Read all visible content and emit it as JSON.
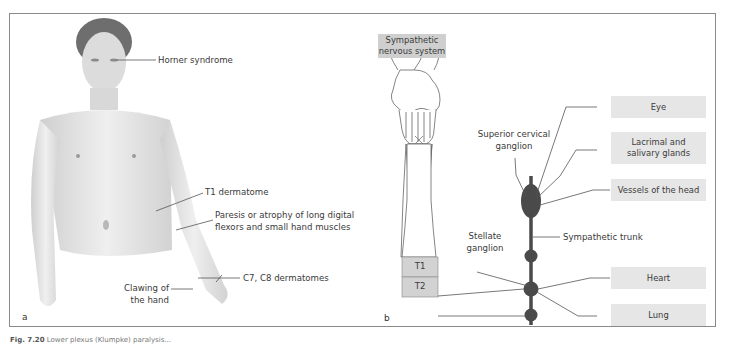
{
  "figure": {
    "panel_a": {
      "letter": "a",
      "labels": {
        "horner": "Horner syndrome",
        "t1_dermatome": "T1 dermatome",
        "paresis_line1": "Paresis or atrophy of long digital",
        "paresis_line2": "flexors and small hand muscles",
        "c7c8": "C7, C8 dermatomes",
        "clawing_line1": "Clawing of",
        "clawing_line2": "the hand"
      }
    },
    "panel_b": {
      "letter": "b",
      "header_box_line1": "Sympathetic",
      "header_box_line2": "nervous system",
      "segments": [
        "T1",
        "T2"
      ],
      "labels": {
        "superior_line1": "Superior cervical",
        "superior_line2": "ganglion",
        "stellate_line1": "Stellate",
        "stellate_line2": "ganglion",
        "trunk": "Sympathetic trunk"
      },
      "targets": [
        {
          "line1": "Eye",
          "line2": ""
        },
        {
          "line1": "Lacrimal and",
          "line2": "salivary glands"
        },
        {
          "line1": "Vessels of the head",
          "line2": ""
        },
        {
          "line1": "Heart",
          "line2": ""
        },
        {
          "line1": "Lung",
          "line2": ""
        }
      ]
    },
    "caption_prefix": "Fig. 7.20",
    "caption_text": "Lower plexus (Klumpke) paralysis..."
  },
  "colors": {
    "box_fill": "#e6e6e6",
    "header_fill": "#cfcfcf",
    "ganglion": "#4a4a4a",
    "line": "#555555"
  }
}
